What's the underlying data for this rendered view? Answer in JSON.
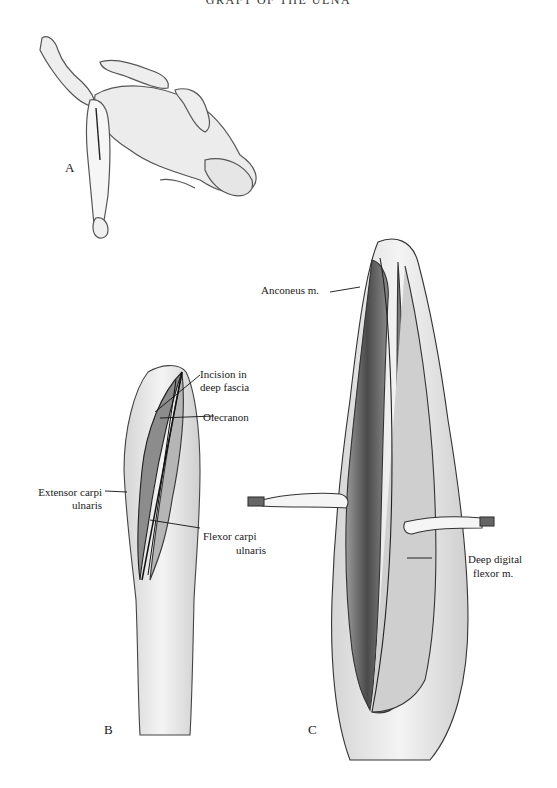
{
  "page": {
    "running_header": "GRAFT OF THE ULNA"
  },
  "figures": [
    {
      "id": "A",
      "letter": "A",
      "description": "Dog in dorsal recumbency with forelimb draped and incision outlined"
    },
    {
      "id": "B",
      "letter": "B",
      "labels": {
        "incision": "Incision in",
        "incision_2": "deep fascia",
        "olecranon": "Olecranon",
        "extensor": "Extensor carpi",
        "extensor_2": "ulnaris",
        "flexor": "Flexor carpi",
        "flexor_2": "ulnaris"
      }
    },
    {
      "id": "C",
      "letter": "C",
      "labels": {
        "anconeus": "Anconeus m.",
        "deep_digital": "Deep digital",
        "deep_digital_2": "flexor m."
      }
    }
  ],
  "colors": {
    "ink": "#1a1a1a",
    "shade": "#6e6e6e",
    "light": "#c8c8c8",
    "paper": "#ffffff"
  }
}
